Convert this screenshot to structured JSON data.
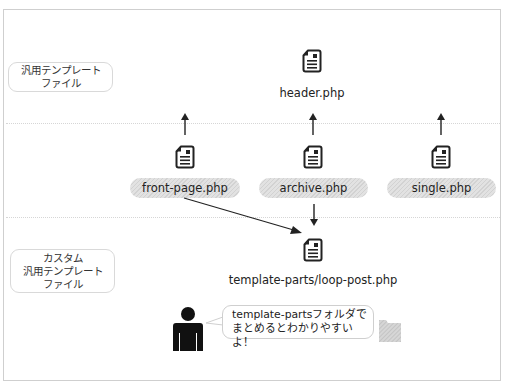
{
  "labels": {
    "general_template": [
      "汎用テンプレート",
      "ファイル"
    ],
    "custom_template": [
      "カスタム",
      "汎用テンプレート",
      "ファイル"
    ]
  },
  "files": {
    "header": "header.php",
    "front_page": "front-page.php",
    "archive": "archive.php",
    "single": "single.php",
    "loop_post": "template-parts/loop-post.php"
  },
  "speech": {
    "line1": "template-partsフォルダで",
    "line2": "まとめるとわかりやすいよ！"
  },
  "icons": {
    "file": "document-icon",
    "person": "person-icon",
    "folder": "folder-icon"
  },
  "colors": {
    "line": "#222222",
    "border": "#cfcfcf",
    "pill": "#dcdcdc",
    "folder": "#d0d0d0"
  }
}
